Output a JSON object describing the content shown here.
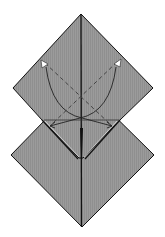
{
  "diagram": {
    "title": "Origami fold step",
    "description": "Two overlapping square diamonds; dashed valley-fold lines with curved arrows folding lower flaps up, plus squash arrows.",
    "colors": {
      "paper": "#9b9b9b",
      "paper_stripe": "#8f8f8f",
      "line": "#111111",
      "dash": "#444444",
      "arrowhead_fill": "#ffffff",
      "background": "#ffffff"
    },
    "shapes": {
      "top_diamond": {
        "top": [
          81,
          14
        ],
        "left": [
          13,
          88
        ],
        "right": [
          153,
          88
        ],
        "bottom": [
          81,
          160
        ]
      },
      "bottom_diamond": {
        "top": [
          81,
          83
        ],
        "left": [
          11,
          155
        ],
        "right": [
          154,
          155
        ],
        "bottom": [
          82,
          227
        ]
      },
      "notch_left": [
        42,
        120
      ],
      "notch_right": [
        120,
        120
      ]
    },
    "annotations": {
      "valley_fold_left": "dashed line from upper-left to lower-right",
      "valley_fold_right": "dashed line from upper-right to lower-left",
      "fold_arrow_left": "curved arrow up-left",
      "fold_arrow_right": "curved arrow up-right",
      "squash_arrow_left": "arrow outward to the left",
      "squash_arrow_right": "arrow outward to the right"
    }
  }
}
